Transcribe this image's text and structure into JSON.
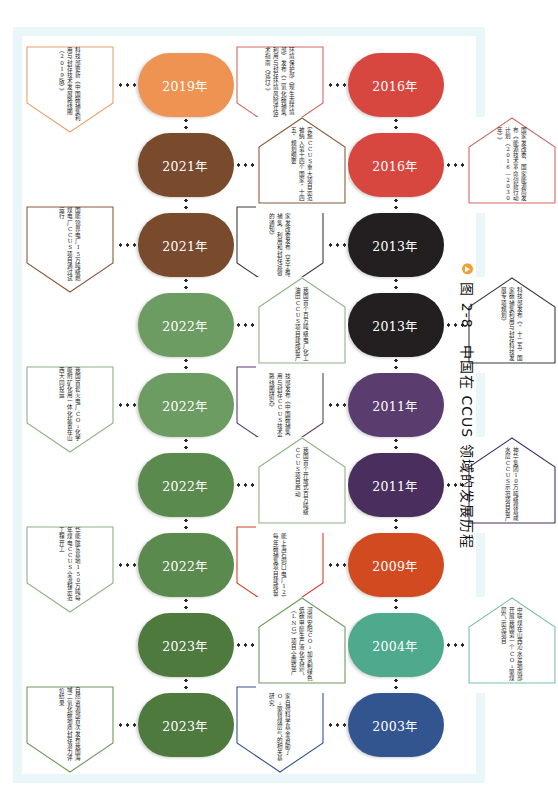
{
  "figure": {
    "caption_label": "图 2-8",
    "caption_title": "中国在 CCUS 领域的发展历程",
    "bullet_icon": "triangle-bullet-icon",
    "frame_color": "#eaf7f9"
  },
  "timeline": {
    "top_row": [
      {
        "year": "2016年",
        "color": "#d8473f",
        "callout_color": "#d06a64",
        "callout_side": "below",
        "text": "环境保护部（现生态环境部）发布《二氧化碳捕集、利用与封存环境风险评估技术指南（试行）》"
      },
      {
        "year": "2016年",
        "color": "#d8473f",
        "callout_color": "#d06a64",
        "callout_side": "above",
        "text": "国家发改委、国家能源局发布《能源技术革命创新行动计划（2016—2030年）》"
      },
      {
        "year": "2013年",
        "color": "#231f20",
        "callout_color": "#3a3a3a",
        "callout_side": "below",
        "text": "国家发改委发布《关于推动碳捕集、利用和封存试验示范的通知》"
      },
      {
        "year": "2013年",
        "color": "#231f20",
        "callout_color": "#3a3a3a",
        "callout_side": "above",
        "text": "科技部发布《“十二五”国家碳捕集利用与封存科技发展专项规划》"
      },
      {
        "year": "2011年",
        "color": "#5a3c6e",
        "callout_color": "#5a3c6e",
        "callout_side": "below",
        "text": "科技部发布《中国碳捕集、利用与封存CCUS技术发展路线图研究》"
      },
      {
        "year": "2011年",
        "color": "#4a2f5e",
        "callout_color": "#4a2f5e",
        "callout_side": "above",
        "text": "神华集团10万吨级煤基咸水层CCUS示范项目投产"
      },
      {
        "year": "2009年",
        "color": "#d24a1f",
        "callout_color": "#d2402a",
        "callout_side": "below",
        "text": "华能上海石洞口电厂12万吨每年碳捕集项目建成投产"
      },
      {
        "year": "2004年",
        "color": "#4fa98c",
        "callout_color": "#7bbfae",
        "callout_side": "above",
        "text": "中联煤在山西沁水盆地南部开展我国第一个CO₂驱煤层气示范项目"
      },
      {
        "year": "2003年",
        "color": "#33558f",
        "callout_color": "#33558f",
        "callout_side": "below",
        "text": "国家自然科学基金资助了CO₂驱替煤层气的相关基础研究"
      }
    ],
    "bottom_row": [
      {
        "year": "2019年",
        "color": "#ef9352",
        "callout_color": "#e8a070",
        "callout_side": "below",
        "text": "科技部更新《中国碳捕集利用与封存技术发展路线图（2019版）》"
      },
      {
        "year": "2021年",
        "color": "#7a4a2c",
        "callout_color": "#8a5a3a",
        "callout_side": "above",
        "text": "实施CCUS重大项目示范被纳入第十四个国家“十四五”规划纲要"
      },
      {
        "year": "2021年",
        "color": "#7a4a2c",
        "callout_color": "#8a5a3a",
        "callout_side": "below",
        "text": "国能锦界电厂15万吨级燃煤电厂CCUS项目通过试运行"
      },
      {
        "year": "2022年",
        "color": "#6d9c63",
        "callout_color": "#8db283",
        "callout_side": "above",
        "text": "我国首个百万吨级电厂化工油田CCUS项目建成投产"
      },
      {
        "year": "2022年",
        "color": "#6d9c63",
        "callout_color": "#8db283",
        "callout_side": "below",
        "text": "我国首套火电厂CO₂化学吸附矿化用一体化装置在山西大同投运"
      },
      {
        "year": "2022年",
        "color": "#5b8a4e",
        "callout_color": "#8db283",
        "callout_side": "above",
        "text": "我国首个开放式百万吨级CCUS项目启动"
      },
      {
        "year": "2022年",
        "color": "#5b8a4e",
        "callout_color": "#8db283",
        "callout_side": "below",
        "text": "华能陇东基地150万吨每年煤电CCUS全流程示范工程开工"
      },
      {
        "year": "2023年",
        "color": "#4e7a3e",
        "callout_color": "#6f9a5e",
        "callout_side": "above",
        "text": "河南安阳CO₂加氢制绿色低碳甲醇生产液化天然气（LNG）项目全面投产"
      },
      {
        "year": "2023年",
        "color": "#4e7a3e",
        "callout_color": "#6f9a5e",
        "callout_side": "below",
        "text": "自然资源部首次发布我国海域二氧化碳地质封存潜力评价结果"
      }
    ]
  }
}
